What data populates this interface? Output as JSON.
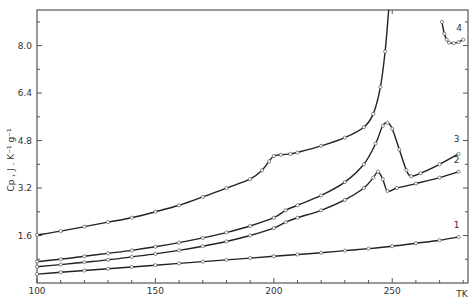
{
  "chart_data": {
    "type": "line",
    "title": "",
    "xlabel": "TK",
    "ylabel": "Cp , J . K⁻¹ g⁻¹",
    "xlim": [
      100,
      282
    ],
    "ylim": [
      0,
      9.2
    ],
    "x_ticks": [
      100,
      150,
      200,
      250
    ],
    "x_tick_labels": [
      "100",
      "150",
      "200",
      "250"
    ],
    "y_ticks": [
      1.6,
      3.2,
      4.8,
      6.4,
      8.0
    ],
    "y_tick_labels": [
      "1.6",
      "3.2",
      "4.8",
      "6.4",
      "8.0"
    ],
    "grid": false,
    "legend": "none (curves numbered inline 1-4)",
    "series": [
      {
        "name": "4",
        "label": "4",
        "marker": "open-circle",
        "x": [
          100,
          110,
          120,
          130,
          140,
          150,
          160,
          170,
          180,
          190,
          195,
          198,
          200,
          203,
          207,
          210,
          220,
          230,
          238,
          242,
          245,
          247,
          248.5
        ],
        "y": [
          1.62,
          1.75,
          1.9,
          2.05,
          2.2,
          2.4,
          2.62,
          2.9,
          3.2,
          3.5,
          3.8,
          4.1,
          4.28,
          4.32,
          4.35,
          4.4,
          4.62,
          4.9,
          5.25,
          5.7,
          6.6,
          7.8,
          9.2
        ]
      },
      {
        "name": "4 (high-T branch)",
        "label": "4",
        "marker": "open-circle",
        "x": [
          271,
          272,
          273,
          274,
          276,
          278,
          280
        ],
        "y": [
          8.8,
          8.4,
          8.2,
          8.1,
          8.08,
          8.12,
          8.2
        ]
      },
      {
        "name": "3",
        "label": "3",
        "marker": "open-circle",
        "x": [
          100,
          110,
          120,
          130,
          140,
          150,
          160,
          170,
          180,
          190,
          200,
          205,
          210,
          220,
          230,
          238,
          243,
          246,
          248,
          250,
          253,
          256,
          258,
          262,
          270,
          278
        ],
        "y": [
          0.72,
          0.8,
          0.9,
          1.0,
          1.1,
          1.22,
          1.36,
          1.52,
          1.7,
          1.92,
          2.2,
          2.45,
          2.62,
          2.95,
          3.4,
          4.0,
          4.7,
          5.3,
          5.4,
          5.2,
          4.5,
          3.8,
          3.6,
          3.7,
          4.0,
          4.35
        ]
      },
      {
        "name": "2",
        "label": "2",
        "marker": "open-circle",
        "x": [
          100,
          110,
          120,
          130,
          140,
          150,
          160,
          170,
          180,
          190,
          200,
          205,
          210,
          220,
          230,
          238,
          242,
          244,
          246,
          248,
          252,
          260,
          270,
          278
        ],
        "y": [
          0.55,
          0.62,
          0.7,
          0.78,
          0.88,
          0.98,
          1.1,
          1.24,
          1.4,
          1.6,
          1.85,
          2.05,
          2.2,
          2.45,
          2.8,
          3.2,
          3.55,
          3.75,
          3.5,
          3.1,
          3.2,
          3.35,
          3.55,
          3.75
        ]
      },
      {
        "name": "1",
        "label": "1",
        "marker": "open-circle",
        "x": [
          100,
          110,
          120,
          130,
          140,
          150,
          160,
          170,
          180,
          190,
          200,
          210,
          220,
          230,
          240,
          250,
          260,
          270,
          278
        ],
        "y": [
          0.3,
          0.36,
          0.42,
          0.48,
          0.54,
          0.6,
          0.66,
          0.72,
          0.78,
          0.84,
          0.9,
          0.96,
          1.02,
          1.09,
          1.16,
          1.24,
          1.34,
          1.44,
          1.55
        ]
      }
    ]
  }
}
